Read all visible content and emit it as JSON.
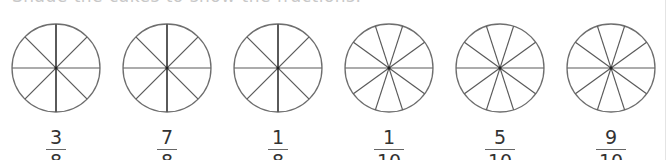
{
  "instruction": "Shade the cakes to show the fractions.",
  "colors": {
    "circle_stroke": "#6e6e6e",
    "divider_stroke": "#5a5a5a",
    "text": "#333333"
  },
  "cakes": [
    {
      "slices": 8,
      "numerator": "3",
      "denominator": "8"
    },
    {
      "slices": 8,
      "numerator": "7",
      "denominator": "8"
    },
    {
      "slices": 8,
      "numerator": "1",
      "denominator": "8"
    },
    {
      "slices": 10,
      "numerator": "1",
      "denominator": "10"
    },
    {
      "slices": 10,
      "numerator": "5",
      "denominator": "10"
    },
    {
      "slices": 10,
      "numerator": "9",
      "denominator": "10"
    }
  ]
}
